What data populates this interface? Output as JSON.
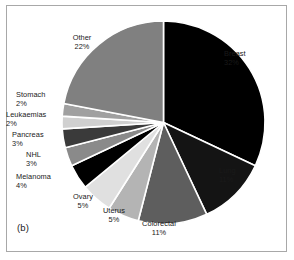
{
  "figure": {
    "panel_caption": "(b)",
    "background_color": "#ffffff",
    "frame_color": "#a8a8a8",
    "separator_color": "#ffffff"
  },
  "chart_data": {
    "type": "pie",
    "title": "",
    "subtitle": "",
    "xlabel": "",
    "ylabel": "",
    "grid": false,
    "legend_position": "none",
    "labels_position": "outside-callout",
    "start_angle_deg": 0,
    "direction": "clockwise",
    "unit": "%",
    "total": 100,
    "categories": [
      "Breast",
      "Lung",
      "Colorectal",
      "Uterus",
      "Ovary",
      "Melanoma",
      "NHL",
      "Pancreas",
      "Leukaemias",
      "Stomach",
      "Other"
    ],
    "values": [
      32,
      11,
      11,
      5,
      5,
      4,
      3,
      3,
      2,
      2,
      22
    ],
    "colors": [
      "#000000",
      "#141414",
      "#5e5e5e",
      "#b4b4b4",
      "#e0e0e0",
      "#000000",
      "#8a8a8a",
      "#3a3a3a",
      "#d0d0d0",
      "#a0a0a0",
      "#808080"
    ],
    "slices": [
      {
        "label": "Breast",
        "value": 32,
        "value_text": "32%",
        "color": "#000000"
      },
      {
        "label": "Lung",
        "value": 11,
        "value_text": "11%",
        "color": "#141414"
      },
      {
        "label": "Colorectal",
        "value": 11,
        "value_text": "11%",
        "color": "#5e5e5e"
      },
      {
        "label": "Uterus",
        "value": 5,
        "value_text": "5%",
        "color": "#b4b4b4"
      },
      {
        "label": "Ovary",
        "value": 5,
        "value_text": "5%",
        "color": "#e0e0e0"
      },
      {
        "label": "Melanoma",
        "value": 4,
        "value_text": "4%",
        "color": "#000000"
      },
      {
        "label": "NHL",
        "value": 3,
        "value_text": "3%",
        "color": "#8a8a8a"
      },
      {
        "label": "Pancreas",
        "value": 3,
        "value_text": "3%",
        "color": "#3a3a3a"
      },
      {
        "label": "Leukaemias",
        "value": 2,
        "value_text": "2%",
        "color": "#d0d0d0"
      },
      {
        "label": "Stomach",
        "value": 2,
        "value_text": "2%",
        "color": "#a0a0a0"
      },
      {
        "label": "Other",
        "value": 22,
        "value_text": "22%",
        "color": "#808080"
      }
    ]
  }
}
